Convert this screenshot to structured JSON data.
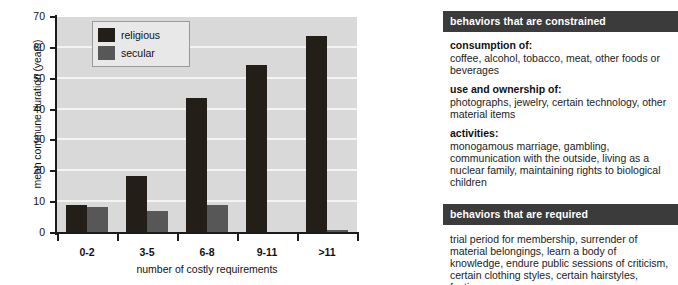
{
  "chart_data": {
    "type": "bar",
    "title": "",
    "xlabel": "number of costly requirements",
    "ylabel": "mean commune duration (years)",
    "categories": [
      "0-2",
      "3-5",
      "6-8",
      "9-11",
      ">11"
    ],
    "series": [
      {
        "name": "religious",
        "color": "#231f18",
        "values": [
          9,
          18.5,
          43.7,
          54.5,
          64
        ]
      },
      {
        "name": "secular",
        "color": "#575757",
        "values": [
          8.3,
          7,
          9,
          0,
          1
        ]
      }
    ],
    "ylim": [
      0,
      70
    ],
    "yticks": [
      0,
      10,
      20,
      30,
      40,
      50,
      60,
      70
    ],
    "ytick_labels": [
      "0",
      "10",
      "20",
      "30",
      "40",
      "50",
      "60",
      "70"
    ],
    "grid": true,
    "legend_position": "top-left",
    "plot_background": "#d9d9d9",
    "gridline_color": "#f4f4f4"
  },
  "legend": {
    "items": [
      {
        "label": "religious",
        "color": "#231f18"
      },
      {
        "label": "secular",
        "color": "#575757"
      }
    ]
  },
  "side_panel": {
    "constrained": {
      "header": "behaviors that are constrained",
      "groups": [
        {
          "title": "consumption of:",
          "text": "coffee, alcohol, tobacco, meat, other foods or beverages"
        },
        {
          "title": "use and ownership of:",
          "text": "photographs, jewelry, certain technology, other material items"
        },
        {
          "title": "activities:",
          "text": "monogamous marriage, gambling, communication with the outside, living as a nuclear family, maintaining rights to biological children"
        }
      ]
    },
    "required": {
      "header": "behaviors that are required",
      "text": "trial period for membership, surrender of material belongings, learn a body of knowledge, endure public sessions of criticism, certain clothing styles, certain hairstyles, fasting"
    }
  },
  "colors": {
    "header_bar": "#3b3b3b",
    "header_text": "#ffffff",
    "axis": "#1a1a1a",
    "page_background": "#ffffff"
  }
}
